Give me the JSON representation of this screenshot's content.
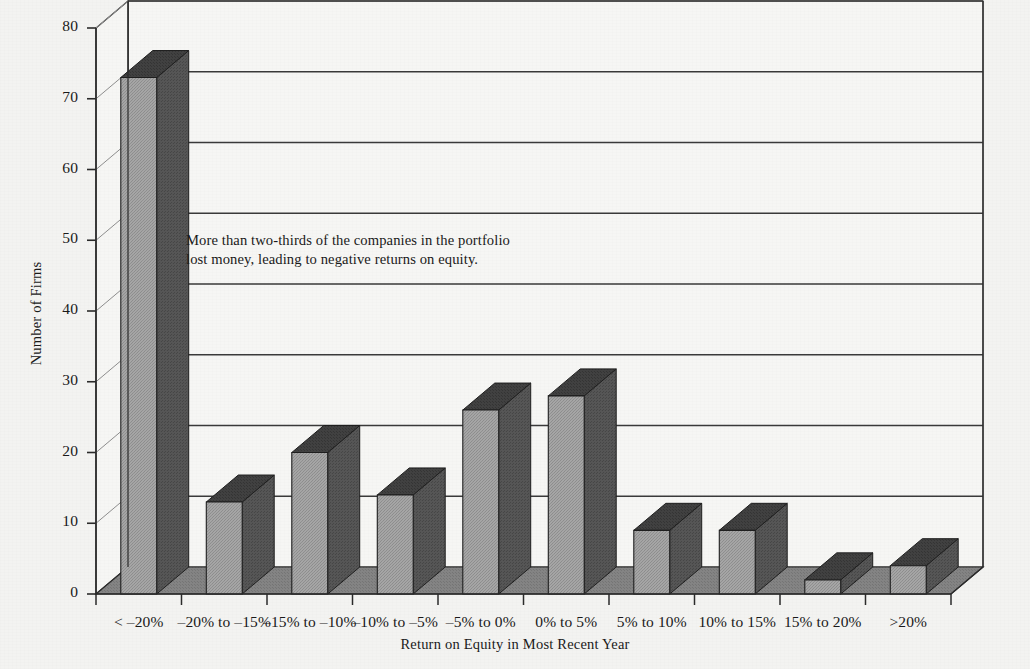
{
  "chart_data": {
    "type": "bar",
    "title": "",
    "xlabel": "Return on Equity in Most Recent Year",
    "ylabel": "Number of Firms",
    "categories": [
      "< –20%",
      "–20% to –15%",
      "–15% to –10%",
      "–10% to –5%",
      "–5% to 0%",
      "0% to 5%",
      "5% to 10%",
      "10% to 15%",
      "15% to 20%",
      ">20%"
    ],
    "values": [
      73,
      13,
      20,
      14,
      26,
      28,
      9,
      9,
      2,
      4
    ],
    "ylim": [
      0,
      80
    ],
    "yticks": [
      "0",
      "10",
      "20",
      "30",
      "40",
      "50",
      "60",
      "70",
      "80"
    ],
    "ytick_values": [
      0,
      10,
      20,
      30,
      40,
      50,
      60,
      70,
      80
    ],
    "grid": true,
    "legend": "none",
    "style": "3d-columns",
    "annotations": [
      {
        "text": "More than two-thirds of the companies in the portfolio lost money, leading to negative returns on equity."
      }
    ]
  },
  "colors": {
    "background": "#f3f3f1",
    "bar_front": "#9d9d9d",
    "bar_side": "#4f4f4f",
    "bar_top": "#3c3c3c",
    "floor": "#7e7e7e",
    "wall": "#f6f6f4",
    "axis": "#2b2b2b",
    "grid": "#3a3a3a",
    "text": "#1a1a1a"
  }
}
